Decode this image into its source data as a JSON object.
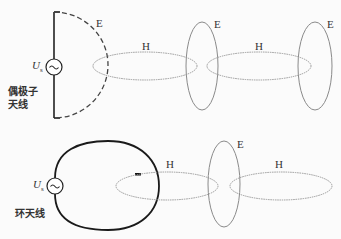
{
  "diagram": {
    "dipole": {
      "label_line1": "偶极子",
      "label_line2": "天线",
      "source_symbol": "U",
      "source_subscript": "s",
      "field_label_E": "E"
    },
    "loop": {
      "label": "环天线",
      "source_symbol": "U",
      "source_subscript": "s"
    },
    "top_row": {
      "h_labels": [
        "H",
        "H"
      ],
      "e_labels": [
        "E",
        "E"
      ]
    },
    "bottom_row": {
      "h_labels": [
        "H",
        "H"
      ],
      "e_labels": [
        "E"
      ]
    },
    "source_glyph": "~",
    "colors": {
      "antenna": "#222222",
      "field_lines": "#9a9a9a",
      "text": "#333333"
    }
  }
}
